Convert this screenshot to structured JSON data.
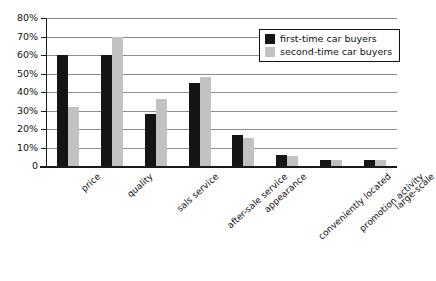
{
  "chart_data": {
    "type": "bar",
    "title": "",
    "subtitle": "",
    "xlabel": "",
    "ylabel": "",
    "ylim": [
      0,
      80
    ],
    "ytick_labels": [
      "80%",
      "70%",
      "60%",
      "50%",
      "40%",
      "30%",
      "20%",
      "10%",
      "0"
    ],
    "ytick_values": [
      80,
      70,
      60,
      50,
      40,
      30,
      20,
      10,
      0
    ],
    "grid": true,
    "legend_position": "upper right",
    "categories": [
      "price",
      "quality",
      "sals service",
      "after-sale service",
      "appearance",
      "conveniently located",
      "promotion activity",
      "large-scale"
    ],
    "series": [
      {
        "name": "first-time car buyers",
        "color": "#151515",
        "values": [
          60,
          60,
          28,
          45,
          17,
          6,
          3,
          3.5
        ]
      },
      {
        "name": "second-time car buyers",
        "color": "#c2c2c2",
        "values": [
          32,
          70,
          36,
          48,
          15,
          5.5,
          3,
          3
        ]
      }
    ]
  }
}
